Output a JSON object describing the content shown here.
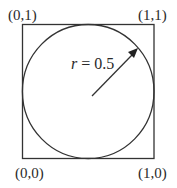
{
  "diagram": {
    "corners": {
      "top_left": "(0,1)",
      "top_right": "(1,1)",
      "bottom_left": "(0,0)",
      "bottom_right": "(1,0)"
    },
    "radius_label_var": "r",
    "radius_label_rest": " = 0.5",
    "stroke_color": "#333333"
  }
}
